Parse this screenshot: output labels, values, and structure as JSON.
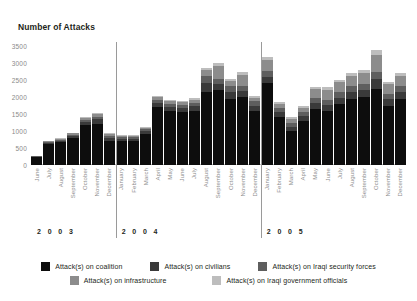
{
  "chart_data": {
    "type": "bar",
    "title": "Number of Attacks",
    "xlabel": "",
    "ylabel": "Number of Attacks",
    "ylim": [
      0,
      3500
    ],
    "yticks": [
      3500,
      3000,
      2500,
      2000,
      1500,
      1000,
      500,
      0
    ],
    "grid": false,
    "legend_position": "bottom",
    "stacked": true,
    "categories": [
      "June",
      "July",
      "August",
      "September",
      "October",
      "November",
      "December",
      "January",
      "February",
      "March",
      "April",
      "May",
      "June",
      "July",
      "August",
      "September",
      "October",
      "November",
      "December",
      "January",
      "February",
      "March",
      "April",
      "May",
      "June",
      "July",
      "August",
      "September",
      "October",
      "November",
      "December"
    ],
    "group_labels": [
      "2 0 0 3",
      "2 0 0 4",
      "2 0 0 5"
    ],
    "groups": [
      {
        "label": "2 0 0 3",
        "start": 0,
        "count": 7
      },
      {
        "label": "2 0 0 4",
        "start": 7,
        "count": 12
      },
      {
        "label": "2 0 0 5",
        "start": 19,
        "count": 12
      }
    ],
    "series": [
      {
        "name": "Attack(s) on coalition",
        "color": "#0d0d0d",
        "values": [
          230,
          620,
          680,
          790,
          1180,
          1220,
          720,
          700,
          700,
          920,
          1700,
          1600,
          1550,
          1600,
          2150,
          2200,
          1950,
          2000,
          1600,
          2400,
          1400,
          1000,
          1300,
          1650,
          1600,
          1800,
          1950,
          2000,
          2250,
          1750,
          1950
        ]
      },
      {
        "name": "Attack(s) on civilians",
        "color": "#3a3a3a",
        "values": [
          20,
          40,
          40,
          60,
          90,
          120,
          80,
          60,
          60,
          70,
          120,
          110,
          120,
          130,
          260,
          180,
          200,
          180,
          150,
          200,
          150,
          130,
          140,
          170,
          160,
          180,
          200,
          200,
          280,
          180,
          200
        ]
      },
      {
        "name": "Attack(s) on Iraqi security forces",
        "color": "#5e5e5e",
        "values": [
          10,
          20,
          30,
          40,
          60,
          80,
          60,
          50,
          50,
          60,
          90,
          90,
          90,
          100,
          200,
          150,
          160,
          150,
          120,
          180,
          120,
          110,
          120,
          140,
          150,
          160,
          170,
          180,
          220,
          160,
          170
        ]
      },
      {
        "name": "Attack(s) on infrastructure",
        "color": "#8c8c8c",
        "values": [
          10,
          20,
          30,
          40,
          60,
          70,
          50,
          40,
          40,
          50,
          80,
          80,
          80,
          90,
          180,
          380,
          150,
          320,
          110,
          320,
          120,
          110,
          120,
          280,
          300,
          300,
          310,
          320,
          500,
          280,
          300
        ]
      },
      {
        "name": "Attack(s) on Iraqi government officials",
        "color": "#bdbdbd",
        "values": [
          5,
          10,
          15,
          20,
          25,
          30,
          25,
          20,
          20,
          25,
          35,
          35,
          35,
          40,
          60,
          90,
          60,
          80,
          50,
          80,
          50,
          50,
          50,
          70,
          75,
          75,
          80,
          85,
          120,
          70,
          80
        ]
      }
    ]
  },
  "legend": {
    "rows": [
      [
        {
          "label": "Attack(s) on coalition",
          "color": "#0d0d0d"
        },
        {
          "label": "Attack(s) on civilians",
          "color": "#3a3a3a"
        },
        {
          "label": "Attack(s) on Iraqi security forces",
          "color": "#5e5e5e"
        }
      ],
      [
        {
          "label": "Attack(s) on infrastructure",
          "color": "#8c8c8c"
        },
        {
          "label": "Attack(s) on Iraqi government officials",
          "color": "#bdbdbd"
        }
      ]
    ]
  },
  "colors": {
    "axis_text": "#8a8a8a",
    "title_text": "#231f20",
    "separator": "#9a9a9a",
    "baseline": "#b9b9b9"
  }
}
